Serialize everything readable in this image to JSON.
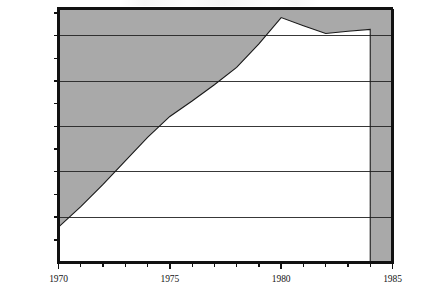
{
  "chart_data": {
    "type": "area",
    "title": "",
    "xlabel": "",
    "ylabel": "",
    "x": [
      1970,
      1971,
      1972,
      1973,
      1974,
      1975,
      1976,
      1977,
      1978,
      1979,
      1980,
      1981,
      1982,
      1983,
      1984
    ],
    "values": [
      7800,
      12300,
      17200,
      22400,
      27600,
      32200,
      35600,
      39200,
      43000,
      48200,
      54000,
      52200,
      50500,
      51000,
      51400
    ],
    "series": [
      {
        "name": "Value",
        "values": [
          7800,
          12300,
          17200,
          22400,
          27600,
          32200,
          35600,
          39200,
          43000,
          48200,
          54000,
          52200,
          50500,
          51000,
          51400
        ]
      }
    ],
    "xlim": [
      1970,
      1985
    ],
    "ylim": [
      0,
      56000
    ],
    "grid": true,
    "grid_values": [
      10000,
      20000,
      30000,
      40000,
      50000
    ],
    "legend": "none",
    "fill": "above-curve",
    "fill_color": "#a9a9a9",
    "plot_bg": "#ffffff",
    "line_color": "#1a1a1a",
    "axis_color": "#111111",
    "yaxis": {
      "ticks": [
        {
          "value": 5000,
          "label": "$5,000"
        },
        {
          "value": 10000,
          "label": "$10,000"
        },
        {
          "value": 15000,
          "label": "$15,000"
        },
        {
          "value": 20000,
          "label": "$20,000"
        },
        {
          "value": 25000,
          "label": "$25,000"
        },
        {
          "value": 30000,
          "label": "$30,000"
        },
        {
          "value": 35000,
          "label": "$35,000"
        },
        {
          "value": 40000,
          "label": "$40,000"
        },
        {
          "value": 45000,
          "label": "$45,000"
        },
        {
          "value": 50000,
          "label": "$50,000"
        },
        {
          "value": 55000,
          "label": "$55,000"
        }
      ]
    },
    "xaxis": {
      "minor_ticks": [
        1970,
        1971,
        1972,
        1973,
        1974,
        1975,
        1976,
        1977,
        1978,
        1979,
        1980,
        1981,
        1982,
        1983,
        1984,
        1985
      ],
      "ticks": [
        {
          "value": 1970,
          "label": "1970"
        },
        {
          "value": 1975,
          "label": "1975"
        },
        {
          "value": 1980,
          "label": "1980"
        },
        {
          "value": 1985,
          "label": "1985"
        }
      ]
    },
    "annotations": []
  }
}
